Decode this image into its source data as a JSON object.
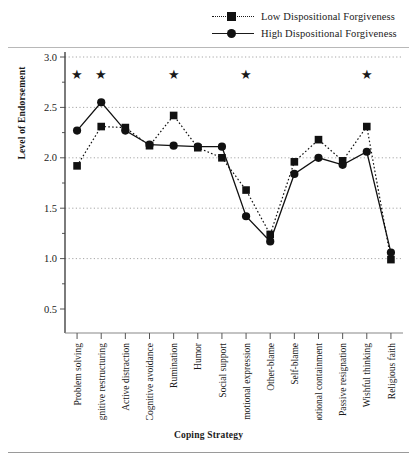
{
  "chart_data": {
    "type": "line",
    "title": "",
    "xlabel": "Coping Strategy",
    "ylabel": "Level of Endorsement",
    "ylim": [
      0.5,
      3.0
    ],
    "yticks": [
      "0.5",
      "1.0",
      "1.5",
      "2.0",
      "2.5",
      "3.0"
    ],
    "grid": true,
    "legend_position": "top-right",
    "categories": [
      "Problem solving",
      "Cognitive restructuring",
      "Active distraction",
      "Cognitive avoidance",
      "Rumination",
      "Humor",
      "Social support",
      "Emotional expression",
      "Other-blame",
      "Self-blame",
      "Emotional containment",
      "Passive resignation",
      "Wishful thinking",
      "Religious faith"
    ],
    "series": [
      {
        "name": "Low Dispositional Forgiveness",
        "marker": "square",
        "line": "dotted",
        "color": "#111111",
        "values": [
          1.92,
          2.31,
          2.3,
          2.12,
          2.42,
          2.1,
          2.0,
          1.68,
          1.24,
          1.96,
          2.18,
          1.97,
          2.31,
          0.99
        ]
      },
      {
        "name": "High Dispositional Forgiveness",
        "marker": "circle",
        "line": "solid",
        "color": "#111111",
        "values": [
          2.27,
          2.55,
          2.27,
          2.13,
          2.12,
          2.11,
          2.11,
          1.42,
          1.17,
          1.84,
          2.0,
          1.93,
          2.06,
          1.06
        ]
      }
    ],
    "significance_marker": "★",
    "significant_categories": [
      "Problem solving",
      "Cognitive restructuring",
      "Rumination",
      "Emotional expression",
      "Wishful thinking"
    ]
  },
  "legend": {
    "items": [
      {
        "label": "Low Dispositional Forgiveness",
        "marker": "square",
        "line": "dotted"
      },
      {
        "label": "High Dispositional Forgiveness",
        "marker": "circle",
        "line": "solid"
      }
    ]
  }
}
